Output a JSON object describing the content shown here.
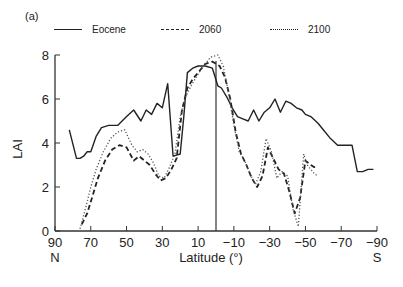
{
  "figure": {
    "panel_label": "(a)",
    "legend": [
      {
        "label": "Eocene",
        "style": "solid"
      },
      {
        "label": "2060",
        "style": "dashed"
      },
      {
        "label": "2100",
        "style": "dotted"
      }
    ],
    "ylabel": "LAI",
    "xlabel": "Latitude (°)",
    "x_end_labels": {
      "left": "N",
      "right": "S"
    }
  },
  "chart_data": {
    "type": "line",
    "title": "",
    "xlabel": "Latitude (°)",
    "ylabel": "LAI",
    "xlim": [
      90,
      -90
    ],
    "ylim": [
      0,
      8
    ],
    "xticks": [
      90,
      70,
      50,
      30,
      10,
      -10,
      -30,
      -50,
      -70,
      -90
    ],
    "yticks": [
      0,
      2,
      4,
      6,
      8
    ],
    "grid": false,
    "legend_position": "top",
    "annotations": [
      "(a)",
      "N",
      "S",
      "vertical line at latitude 0"
    ],
    "series": [
      {
        "name": "Eocene",
        "style": "solid",
        "x": [
          82,
          78,
          76,
          74,
          72,
          70,
          67,
          64,
          60,
          55,
          50,
          46,
          42,
          39,
          36,
          33,
          30,
          27,
          24,
          20,
          18,
          16,
          13,
          10,
          6,
          2,
          -1,
          -3,
          -6,
          -9,
          -12,
          -15,
          -18,
          -21,
          -24,
          -27,
          -30,
          -33,
          -36,
          -39,
          -42,
          -45,
          -48,
          -50,
          -53,
          -57,
          -60,
          -64,
          -68,
          -72,
          -76,
          -79,
          -82,
          -85,
          -88
        ],
        "values": [
          4.6,
          3.3,
          3.3,
          3.4,
          3.6,
          3.6,
          4.3,
          4.7,
          4.8,
          4.8,
          5.2,
          5.5,
          5.0,
          5.5,
          5.3,
          5.8,
          5.6,
          6.7,
          3.4,
          3.5,
          5.2,
          7.2,
          7.4,
          7.5,
          7.5,
          7.4,
          6.6,
          6.5,
          6.1,
          5.6,
          5.2,
          5.1,
          5.0,
          5.5,
          5.0,
          5.4,
          5.6,
          6.0,
          5.4,
          5.9,
          5.8,
          5.6,
          5.5,
          5.3,
          5.2,
          4.9,
          4.6,
          4.2,
          3.9,
          3.9,
          3.9,
          2.7,
          2.7,
          2.8,
          2.8
        ]
      },
      {
        "name": "2060",
        "style": "dashed",
        "x": [
          75,
          72,
          69,
          66,
          62,
          58,
          54,
          50,
          46,
          43,
          40,
          37,
          34,
          31,
          28,
          25,
          22,
          19,
          16,
          13,
          10,
          6,
          2,
          -2,
          -5,
          -8,
          -11,
          -14,
          -17,
          -20,
          -23,
          -26,
          -29,
          -32,
          -35,
          -38,
          -41,
          -44,
          -47,
          -50,
          -53,
          -55,
          -57
        ],
        "values": [
          0.3,
          0.8,
          1.6,
          2.4,
          3.2,
          3.7,
          3.9,
          3.8,
          3.2,
          3.4,
          3.2,
          3.0,
          2.6,
          2.3,
          2.4,
          2.8,
          3.3,
          5.5,
          6.5,
          6.9,
          7.2,
          7.6,
          7.7,
          7.5,
          7.0,
          6.0,
          4.5,
          3.5,
          3.0,
          2.4,
          2.0,
          2.5,
          3.8,
          3.3,
          2.8,
          2.6,
          1.8,
          0.8,
          1.5,
          3.2,
          3.0,
          2.9,
          2.9
        ]
      },
      {
        "name": "2100",
        "style": "dotted",
        "x": [
          76,
          73,
          70,
          67,
          63,
          59,
          55,
          51,
          47,
          44,
          41,
          38,
          35,
          32,
          29,
          26,
          23,
          20,
          17,
          14,
          11,
          7,
          3,
          -1,
          -4,
          -7,
          -10,
          -13,
          -16,
          -19,
          -22,
          -25,
          -28,
          -31,
          -34,
          -37,
          -40,
          -43,
          -46,
          -49,
          -51,
          -53,
          -55,
          -57
        ],
        "values": [
          0.1,
          1.0,
          2.0,
          2.8,
          3.6,
          4.2,
          4.5,
          4.6,
          3.9,
          3.6,
          3.7,
          3.5,
          3.1,
          2.5,
          2.4,
          2.9,
          3.5,
          5.2,
          6.1,
          6.6,
          7.0,
          7.5,
          7.9,
          8.0,
          7.5,
          6.3,
          4.8,
          3.6,
          3.2,
          2.6,
          2.1,
          2.7,
          4.2,
          3.6,
          2.4,
          2.7,
          2.5,
          1.0,
          0.2,
          3.5,
          3.0,
          2.8,
          2.6,
          2.5
        ]
      }
    ]
  }
}
